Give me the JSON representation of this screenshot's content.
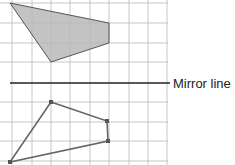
{
  "diagram": {
    "mirror_line_label": "Mirror line",
    "grid": {
      "x_lines": [
        12,
        32,
        51,
        70,
        90,
        109,
        129,
        148,
        167
      ],
      "y_lines": [
        3,
        23,
        43,
        62,
        102,
        122,
        141,
        161
      ],
      "color": "#b8b8b8"
    },
    "mirror_line": {
      "y": 83,
      "x1": 10,
      "x2": 170,
      "color": "#222222"
    },
    "original_shape": {
      "points": [
        [
          10,
          3
        ],
        [
          109,
          23
        ],
        [
          109,
          43
        ],
        [
          51,
          62
        ]
      ],
      "fill": "#b9b9b9",
      "stroke": "#555555"
    },
    "reflected_shape": {
      "points": [
        [
          51,
          102
        ],
        [
          107,
          121
        ],
        [
          108,
          141
        ],
        [
          10,
          162
        ]
      ],
      "fill": "none",
      "stroke": "#666666"
    },
    "colors": {
      "background": "#ffffff",
      "text": "#222222"
    }
  }
}
